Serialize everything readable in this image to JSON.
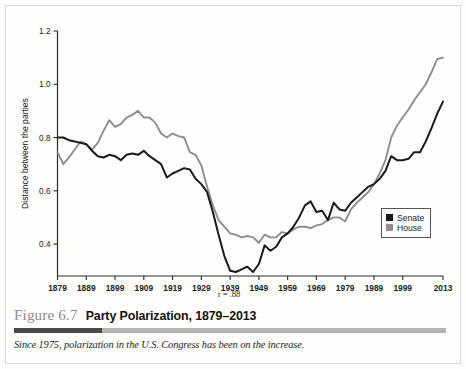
{
  "figure": {
    "number": "Figure 6.7",
    "title": "Party Polarization, 1879–2013",
    "note": "Since 1975, polarization in the U.S. Congress has been on the increase."
  },
  "legend": {
    "items": [
      {
        "label": "Senate",
        "color": "#1a1a1a"
      },
      {
        "label": "House",
        "color": "#8d8d8d"
      }
    ]
  },
  "annotation": {
    "correlation": "r = .88"
  },
  "chart_data": {
    "type": "line",
    "title": "Party Polarization, 1879–2013",
    "xlabel": "",
    "ylabel": "Distance between the parties",
    "xlim": [
      1879,
      2013
    ],
    "ylim": [
      0.28,
      1.2
    ],
    "grid": false,
    "legend_position": "bottom-right",
    "xticks": [
      1879,
      1889,
      1899,
      1909,
      1919,
      1929,
      1939,
      1949,
      1959,
      1969,
      1979,
      1989,
      1999,
      2013
    ],
    "xtick_labels": [
      "1879",
      "1889",
      "1899",
      "1909",
      "1919",
      "1929",
      "1939",
      "1949",
      "1959",
      "1969",
      "1979",
      "1989",
      "1999",
      "2013"
    ],
    "yticks": [
      0.4,
      0.6,
      0.8,
      1.0,
      1.2
    ],
    "ytick_labels": [
      "0.4",
      "0.6",
      "0.8",
      "1.0",
      "1.2"
    ],
    "x": [
      1879,
      1881,
      1883,
      1885,
      1887,
      1889,
      1891,
      1893,
      1895,
      1897,
      1899,
      1901,
      1903,
      1905,
      1907,
      1909,
      1911,
      1913,
      1915,
      1917,
      1919,
      1921,
      1923,
      1925,
      1927,
      1929,
      1931,
      1933,
      1935,
      1937,
      1939,
      1941,
      1943,
      1945,
      1947,
      1949,
      1951,
      1953,
      1955,
      1957,
      1959,
      1961,
      1963,
      1965,
      1967,
      1969,
      1971,
      1973,
      1975,
      1977,
      1979,
      1981,
      1983,
      1985,
      1987,
      1989,
      1991,
      1993,
      1995,
      1997,
      1999,
      2001,
      2003,
      2005,
      2007,
      2009,
      2011,
      2013
    ],
    "series": [
      {
        "name": "Senate",
        "color": "#1a1a1a",
        "values": [
          0.8,
          0.8,
          0.79,
          0.785,
          0.78,
          0.775,
          0.75,
          0.73,
          0.725,
          0.735,
          0.73,
          0.715,
          0.735,
          0.74,
          0.735,
          0.75,
          0.73,
          0.715,
          0.7,
          0.65,
          0.665,
          0.675,
          0.685,
          0.68,
          0.645,
          0.625,
          0.595,
          0.52,
          0.435,
          0.355,
          0.3,
          0.295,
          0.305,
          0.315,
          0.295,
          0.325,
          0.395,
          0.375,
          0.39,
          0.425,
          0.44,
          0.465,
          0.5,
          0.545,
          0.56,
          0.52,
          0.525,
          0.49,
          0.555,
          0.53,
          0.525,
          0.555,
          0.575,
          0.595,
          0.615,
          0.625,
          0.645,
          0.675,
          0.73,
          0.715,
          0.715,
          0.72,
          0.745,
          0.745,
          0.785,
          0.835,
          0.89,
          0.935
        ]
      },
      {
        "name": "House",
        "color": "#8d8d8d",
        "values": [
          0.745,
          0.7,
          0.725,
          0.755,
          0.785,
          0.775,
          0.755,
          0.78,
          0.825,
          0.865,
          0.84,
          0.85,
          0.875,
          0.885,
          0.9,
          0.875,
          0.875,
          0.855,
          0.815,
          0.8,
          0.815,
          0.805,
          0.8,
          0.745,
          0.735,
          0.695,
          0.615,
          0.545,
          0.49,
          0.465,
          0.44,
          0.435,
          0.425,
          0.43,
          0.425,
          0.405,
          0.435,
          0.425,
          0.425,
          0.445,
          0.44,
          0.455,
          0.465,
          0.465,
          0.46,
          0.47,
          0.475,
          0.49,
          0.5,
          0.5,
          0.485,
          0.53,
          0.555,
          0.575,
          0.595,
          0.625,
          0.665,
          0.715,
          0.8,
          0.845,
          0.875,
          0.905,
          0.94,
          0.97,
          1.0,
          1.045,
          1.095,
          1.1
        ]
      }
    ]
  }
}
